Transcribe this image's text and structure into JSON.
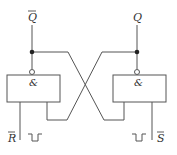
{
  "diagram": {
    "title": "",
    "type": "RS latch (cross-coupled NAND)",
    "outputs": {
      "left": "Q",
      "left_overbar": true,
      "right": "Q",
      "right_overbar": false
    },
    "gates": [
      {
        "name": "left-nand",
        "symbol": "&"
      },
      {
        "name": "right-nand",
        "symbol": "&"
      }
    ],
    "inputs": {
      "left": "R",
      "left_overbar": true,
      "right": "S",
      "right_overbar": true
    },
    "pulse": "negative pulse",
    "colors": {
      "line": "#555555",
      "text": "#333333"
    }
  }
}
